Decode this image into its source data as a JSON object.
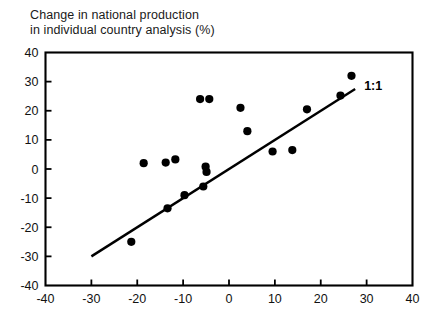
{
  "figure": {
    "title_lines": [
      "Change in national production",
      "in individual country analysis (%)"
    ],
    "background_color": "#ffffff",
    "ink_color": "#000000"
  },
  "chart_data": {
    "type": "scatter",
    "title": "Change in national production in individual country analysis (%)",
    "xlabel": "",
    "ylabel": "",
    "xlim": [
      -40,
      40
    ],
    "ylim": [
      -40,
      40
    ],
    "xticks": [
      -40,
      -30,
      -20,
      -10,
      0,
      10,
      20,
      30,
      40
    ],
    "yticks": [
      -40,
      -30,
      -20,
      -10,
      0,
      10,
      20,
      30,
      40
    ],
    "xtick_labels": [
      "-40",
      "-30",
      "-20",
      "-10",
      "0",
      "10",
      "20",
      "30",
      "40"
    ],
    "ytick_labels": [
      "-40",
      "-30",
      "-20",
      "-10",
      "0",
      "10",
      "20",
      "30",
      "40"
    ],
    "grid": false,
    "legend": "none",
    "marker": "filled-circle",
    "marker_color": "#000000",
    "points": [
      {
        "x": -21.3,
        "y": -25.0
      },
      {
        "x": -18.6,
        "y": 2.0
      },
      {
        "x": -13.8,
        "y": 2.2
      },
      {
        "x": -13.4,
        "y": -13.5
      },
      {
        "x": -11.7,
        "y": 3.3
      },
      {
        "x": -9.7,
        "y": -9.0
      },
      {
        "x": -6.3,
        "y": 24.0
      },
      {
        "x": -5.6,
        "y": -6.0
      },
      {
        "x": -5.1,
        "y": 0.8
      },
      {
        "x": -4.9,
        "y": -1.0
      },
      {
        "x": -4.3,
        "y": 24.0
      },
      {
        "x": 2.5,
        "y": 21.0
      },
      {
        "x": 4.0,
        "y": 13.0
      },
      {
        "x": 9.5,
        "y": 6.0
      },
      {
        "x": 13.8,
        "y": 6.5
      },
      {
        "x": 17.0,
        "y": 20.5
      },
      {
        "x": 24.3,
        "y": 25.2
      },
      {
        "x": 26.7,
        "y": 32.0
      }
    ],
    "reference_line": {
      "label": "1:1",
      "slope": 1,
      "intercept": 0,
      "x_start": -30,
      "y_start": -30,
      "x_end": 27.5,
      "y_end": 27.5
    }
  }
}
